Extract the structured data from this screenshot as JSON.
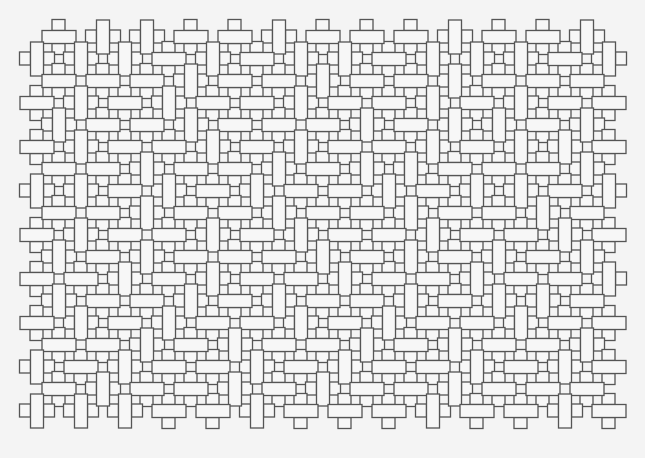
{
  "pattern": {
    "description": "Interlocking rectangular weave pattern (line art)",
    "colors": {
      "background": "#f4f4f4",
      "fill": "#f7f7f7",
      "stroke": "#555555"
    },
    "grid": {
      "origin_even": [
        59,
        37
      ],
      "origin_odd": [
        37,
        59
      ],
      "step_x": 44,
      "step_y": 22,
      "bar_long": 34,
      "bar_short": 13,
      "cap_w": 13,
      "cap_h": 11
    },
    "rows": [
      "HVVHHVHHHVHHV",
      "VVVHVHVVHVVVHV",
      "HHHVHHVHHVHHH",
      "HVHVHHVHHVHVHH",
      "VHHVHHHVHVVHV",
      "HVHHVHVHHVHVVH",
      "HHVHHVHVVHHHV",
      "VVHVHVHHVHVVHV",
      "HHVHHVHHVHHVH",
      "HVHHVHVHHVHHVH",
      "VHVHHHVHVHVHV",
      "HHVHVHHVHHVHHV",
      "VHHVHVHHVHVVH",
      "HVHVHHVHVHHVHH",
      "HHVHVHHVHVHHV",
      "VHVHHVHVHHVHVH",
      "HVHHVHVHHVHHH",
      "VVVHHVHHHVHHVH"
    ]
  }
}
